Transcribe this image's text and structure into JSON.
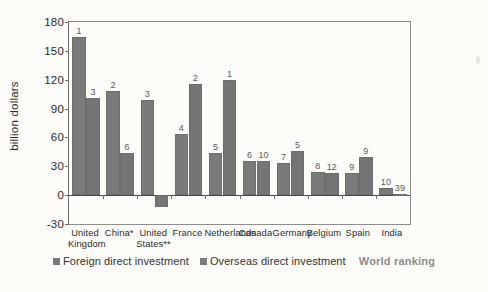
{
  "chart_data": {
    "type": "bar",
    "title": "",
    "xlabel": "",
    "ylabel": "billion dollars",
    "ylim": [
      -30,
      180
    ],
    "yticks": [
      180,
      150,
      120,
      90,
      60,
      30,
      0,
      -30
    ],
    "grid": false,
    "legend_position": "bottom",
    "categories": [
      "United\nKingdom",
      "China*",
      "United\nStates**",
      "France",
      "Netherlands",
      "Canada",
      "Germany",
      "Belgium",
      "Spain",
      "India"
    ],
    "series": [
      {
        "name": "Foreign direct investment",
        "color": "#7a7a7a",
        "values": [
          164,
          108,
          99,
          64,
          44,
          35,
          33,
          24,
          23,
          7
        ],
        "ranks": [
          "1",
          "2",
          "3",
          "4",
          "5",
          "6",
          "7",
          "8",
          "9",
          "10"
        ]
      },
      {
        "name": "Overseas direct investment",
        "color": "#757575",
        "values": [
          101,
          44,
          -12,
          116,
          120,
          35,
          46,
          23,
          40,
          1
        ],
        "ranks": [
          "3",
          "6",
          "",
          "2",
          "1",
          "10",
          "5",
          "12",
          "9",
          "39"
        ]
      }
    ],
    "annotation_legend": "World ranking"
  },
  "legend": {
    "series1_label": "Foreign direct investment",
    "series2_label": "Overseas direct investment",
    "ranking_label": "World ranking"
  }
}
